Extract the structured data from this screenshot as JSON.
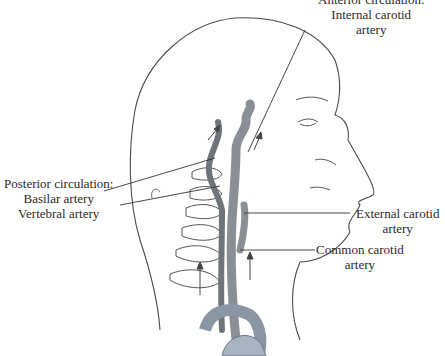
{
  "figure": {
    "type": "anatomical illustration",
    "colors": {
      "line": "#3a3a3a",
      "artery": "#8a8f96",
      "artery_dark": "#5d6168",
      "aorta": "#a9b3bf",
      "background": "#ffffff"
    }
  },
  "labels": {
    "anterior": {
      "title": "Anterior circulation:",
      "line1": "Internal carotid",
      "line2": "artery"
    },
    "posterior": {
      "title": "Posterior circulation:",
      "basilar": "Basilar artery",
      "vertebral": "Vertebral artery"
    },
    "external": {
      "line1": "External carotid",
      "line2": "artery"
    },
    "common": {
      "line1": "Common carotid",
      "line2": "artery"
    }
  }
}
